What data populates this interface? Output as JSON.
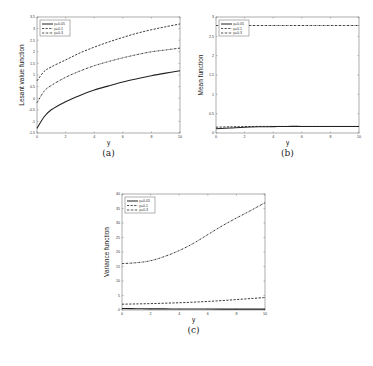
{
  "chart_data": [
    {
      "id": "a",
      "type": "line",
      "sublabel": "(a)",
      "xlabel": "y",
      "ylabel": "Lesant value function",
      "xlim": [
        0,
        10
      ],
      "ylim": [
        -1.5,
        3.5
      ],
      "xticks": [
        0,
        2,
        4,
        6,
        8,
        10
      ],
      "yticks": [
        -1.5,
        -1,
        -0.5,
        0,
        0.5,
        1,
        1.5,
        2,
        2.5,
        3,
        3.5
      ],
      "legend_position": "top-left",
      "x": [
        0,
        0.5,
        1,
        2,
        3,
        4,
        5,
        6,
        7,
        8,
        9,
        10
      ],
      "series": [
        {
          "name": "γ=0.05",
          "style": "solid",
          "values": [
            -1.3,
            -0.8,
            -0.5,
            -0.15,
            0.12,
            0.35,
            0.53,
            0.7,
            0.84,
            0.97,
            1.08,
            1.18
          ]
        },
        {
          "name": "γ=0.1",
          "style": "dashed",
          "values": [
            0.75,
            1.15,
            1.35,
            1.65,
            1.95,
            2.2,
            2.42,
            2.62,
            2.8,
            2.95,
            3.08,
            3.2
          ]
        },
        {
          "name": "γ=0.3",
          "style": "dashdot",
          "values": [
            -0.2,
            0.3,
            0.55,
            0.9,
            1.17,
            1.4,
            1.58,
            1.74,
            1.88,
            2.0,
            2.08,
            2.16
          ]
        }
      ]
    },
    {
      "id": "b",
      "type": "line",
      "sublabel": "(b)",
      "xlabel": "y",
      "ylabel": "Mean function",
      "xlim": [
        0,
        10
      ],
      "ylim": [
        0,
        3
      ],
      "xticks": [
        0,
        2,
        4,
        6,
        8,
        10
      ],
      "yticks": [
        0,
        0.5,
        1,
        1.5,
        2,
        2.5,
        3
      ],
      "legend_position": "top-left",
      "x": [
        0,
        1,
        2,
        3,
        4,
        5,
        6,
        7,
        8,
        9,
        10
      ],
      "series": [
        {
          "name": "γ=0.05",
          "style": "solid",
          "values": [
            0.11,
            0.13,
            0.15,
            0.16,
            0.165,
            0.17,
            0.17,
            0.17,
            0.17,
            0.17,
            0.17
          ]
        },
        {
          "name": "γ=0.1",
          "style": "dashed",
          "values": [
            0.15,
            0.16,
            0.165,
            0.17,
            0.17,
            0.17,
            0.17,
            0.17,
            0.17,
            0.17,
            0.17
          ]
        },
        {
          "name": "γ=0.3",
          "style": "dashdot",
          "values": [
            2.78,
            2.78,
            2.78,
            2.78,
            2.78,
            2.78,
            2.78,
            2.78,
            2.78,
            2.78,
            2.78
          ]
        }
      ]
    },
    {
      "id": "c",
      "type": "line",
      "sublabel": "(c)",
      "xlabel": "y",
      "ylabel": "Variance function",
      "xlim": [
        0,
        10
      ],
      "ylim": [
        0,
        40
      ],
      "xticks": [
        0,
        2,
        4,
        6,
        8,
        10
      ],
      "yticks": [
        0,
        5,
        10,
        15,
        20,
        25,
        30,
        35,
        40
      ],
      "legend_position": "top-left",
      "x": [
        0,
        1,
        2,
        3,
        4,
        5,
        6,
        7,
        8,
        9,
        10
      ],
      "series": [
        {
          "name": "γ=0.05",
          "style": "solid",
          "values": [
            0.5,
            0.45,
            0.4,
            0.38,
            0.35,
            0.33,
            0.32,
            0.31,
            0.3,
            0.3,
            0.3
          ]
        },
        {
          "name": "γ=0.1",
          "style": "dashed",
          "values": [
            2.0,
            2.1,
            2.2,
            2.35,
            2.5,
            2.7,
            2.95,
            3.25,
            3.6,
            3.95,
            4.3
          ]
        },
        {
          "name": "γ=0.3",
          "style": "dashdot",
          "values": [
            16.0,
            16.3,
            17.0,
            18.5,
            20.5,
            23.0,
            26.0,
            29.0,
            31.7,
            34.3,
            37.0
          ]
        }
      ]
    }
  ]
}
